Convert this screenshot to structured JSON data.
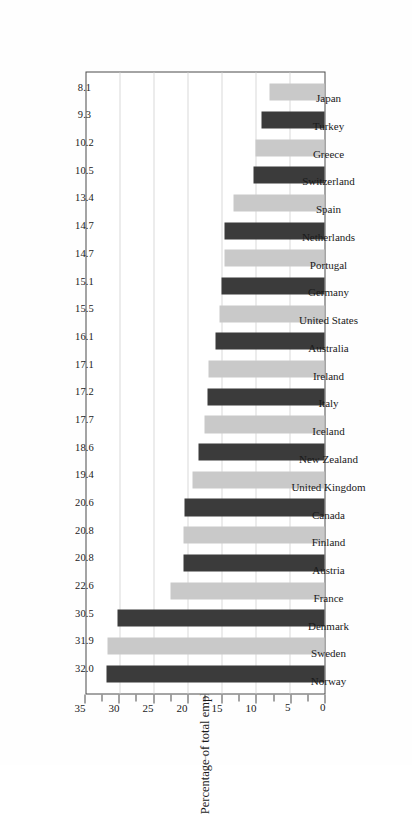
{
  "chart_data": {
    "type": "bar",
    "title": "",
    "xlabel": "",
    "ylabel": "Percentage of total employment",
    "ylim": [
      0,
      35
    ],
    "yticks": [
      0,
      2.5,
      5,
      7.5,
      10,
      12.5,
      15,
      17.5,
      20,
      22.5,
      25,
      27.5,
      30,
      32.5,
      35
    ],
    "ytick_labels": [
      "0",
      "",
      "5",
      "",
      "10",
      "",
      "15",
      "",
      "20",
      "",
      "25",
      "",
      "30",
      "",
      "35"
    ],
    "gridlines_at": [
      5,
      10,
      15,
      20,
      25,
      30
    ],
    "grid": true,
    "legend": "none",
    "orientation": "vertical-bars-on-sideways-printed-page",
    "bar_colors": [
      "#3b3b3b",
      "#c9c9c9"
    ],
    "categories": [
      "Norway",
      "Sweden",
      "Denmark",
      "France",
      "Austria",
      "Finland",
      "Canada",
      "United Kingdom",
      "New Zealand",
      "Iceland",
      "Italy",
      "Ireland",
      "Australia",
      "United States",
      "Germany",
      "Portugal",
      "Netherlands",
      "Spain",
      "Switzerland",
      "Greece",
      "Turkey",
      "Japan"
    ],
    "values": [
      32.0,
      31.9,
      30.5,
      22.6,
      20.8,
      20.8,
      20.6,
      19.4,
      18.6,
      17.7,
      17.2,
      17.1,
      16.1,
      15.5,
      15.1,
      14.7,
      14.7,
      13.4,
      10.5,
      10.2,
      9.3,
      8.1
    ],
    "value_labels": [
      "32.0",
      "31.9",
      "30.5",
      "22.6",
      "20.8",
      "20.8",
      "20.6",
      "19.4",
      "18.6",
      "17.7",
      "17.2",
      "17.1",
      "16.1",
      "15.5",
      "15.1",
      "14.7",
      "14.7",
      "13.4",
      "10.5",
      "10.2",
      "9.3",
      "8.1"
    ]
  },
  "axis": {
    "title": "Percentage of total employment",
    "folio": "i"
  }
}
